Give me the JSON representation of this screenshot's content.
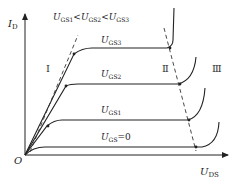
{
  "diagram": {
    "type": "MOSFET output characteristics",
    "axes": {
      "y_label": {
        "main": "I",
        "sub": "D"
      },
      "x_label": {
        "main": "U",
        "sub": "DS"
      },
      "origin": "O"
    },
    "condition": {
      "parts": [
        {
          "main": "U",
          "sub": "GS1"
        },
        {
          "op": "<"
        },
        {
          "main": "U",
          "sub": "GS2"
        },
        {
          "op": "<"
        },
        {
          "main": "U",
          "sub": "GS3"
        }
      ]
    },
    "curves": [
      {
        "label_main": "U",
        "label_sub": "GS3",
        "suffix": ""
      },
      {
        "label_main": "U",
        "label_sub": "GS2",
        "suffix": ""
      },
      {
        "label_main": "U",
        "label_sub": "GS1",
        "suffix": ""
      },
      {
        "label_main": "U",
        "label_sub": "GS",
        "suffix": "=0"
      }
    ],
    "regions": [
      "Ⅰ",
      "Ⅱ",
      "Ⅲ"
    ],
    "colors": {
      "line": "#222222",
      "dashed": "#333333"
    }
  }
}
